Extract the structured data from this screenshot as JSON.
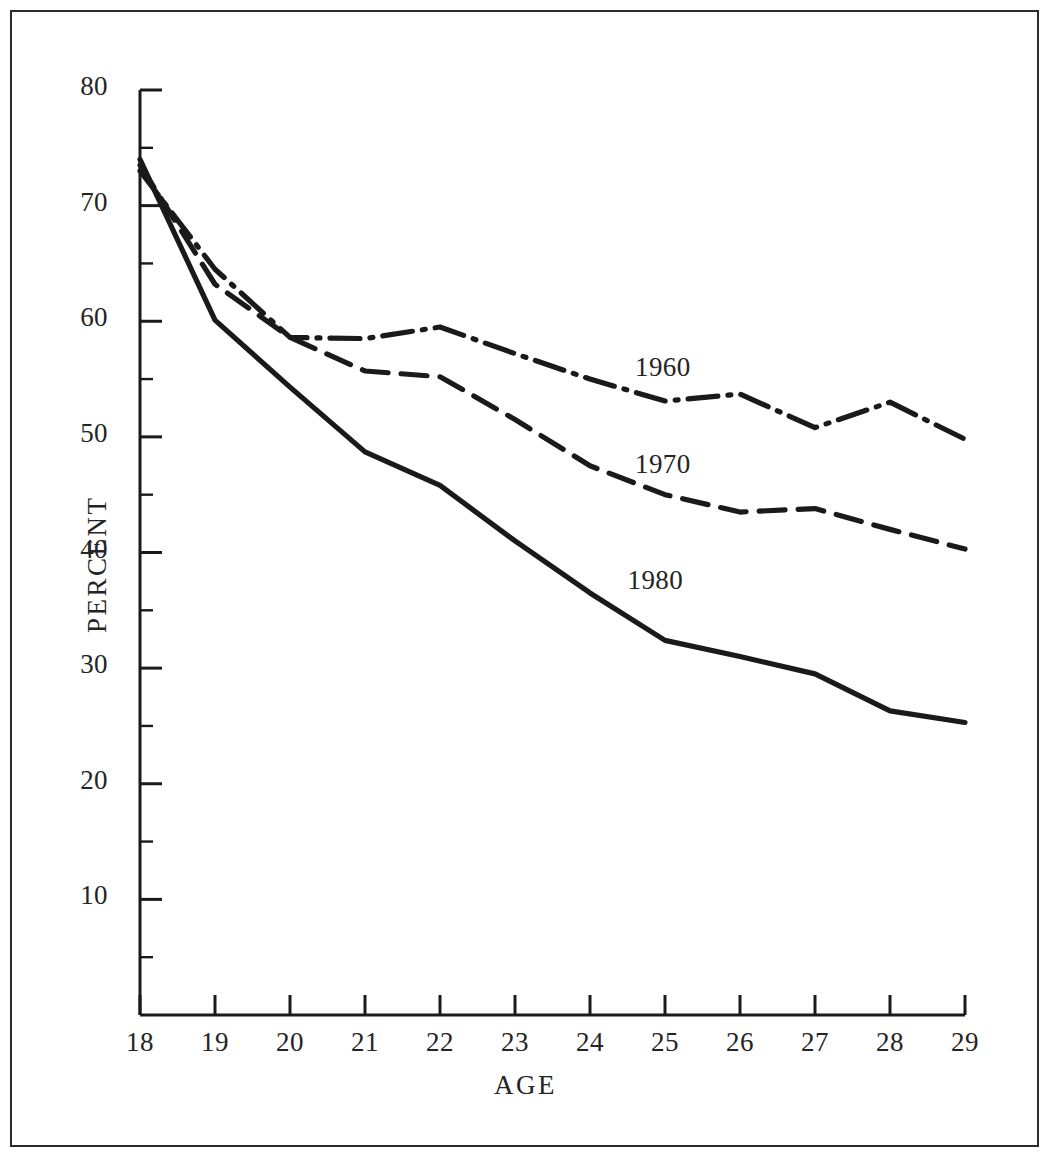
{
  "figure": {
    "background_color": "#ffffff",
    "ink_color": "#1a1a1a",
    "border_color": "#2b2b2b"
  },
  "chart_data": {
    "type": "line",
    "title": "",
    "subtitle": "",
    "xlabel": "AGE",
    "ylabel": "PERCENT",
    "x": [
      18,
      19,
      20,
      21,
      22,
      23,
      24,
      25,
      26,
      27,
      28,
      29
    ],
    "xlim": [
      18,
      29
    ],
    "ylim": [
      0,
      80
    ],
    "xticks": [
      "18",
      "19",
      "20",
      "21",
      "22",
      "23",
      "24",
      "25",
      "26",
      "27",
      "28",
      "29"
    ],
    "yticks": [
      "10",
      "20",
      "30",
      "40",
      "50",
      "60",
      "70",
      "80"
    ],
    "ytick_values": [
      10,
      20,
      30,
      40,
      50,
      60,
      70,
      80
    ],
    "yminor_step": 5,
    "grid": false,
    "legend_position": "inline-annotation",
    "series": [
      {
        "name": "1960",
        "linestyle": "dashdot",
        "color": "#1a1a1a",
        "values": [
          73.0,
          64.5,
          58.6,
          58.5,
          59.5,
          57.2,
          55.0,
          53.1,
          53.7,
          50.8,
          53.0,
          49.8
        ],
        "annotation": {
          "label": "1960",
          "x": 25.0,
          "y": 55.6
        }
      },
      {
        "name": "1970",
        "linestyle": "dashed",
        "color": "#1a1a1a",
        "values": [
          73.5,
          63.2,
          58.6,
          55.7,
          55.2,
          51.5,
          47.5,
          45.0,
          43.5,
          43.8,
          42.0,
          40.3
        ]
      },
      {
        "name": "1980",
        "linestyle": "solid",
        "color": "#1a1a1a",
        "values": [
          74.0,
          60.1,
          54.3,
          48.7,
          45.8,
          41.0,
          36.5,
          32.4,
          31.0,
          29.5,
          26.3,
          25.3
        ],
        "annotation": {
          "label": "1980",
          "x": 24.9,
          "y": 37.2
        }
      }
    ],
    "annotations": [
      {
        "label": "1960",
        "x": 25.0,
        "y": 55.6
      },
      {
        "label": "1970",
        "x": 25.0,
        "y": 47.2
      },
      {
        "label": "1980",
        "x": 24.9,
        "y": 37.2
      }
    ]
  }
}
